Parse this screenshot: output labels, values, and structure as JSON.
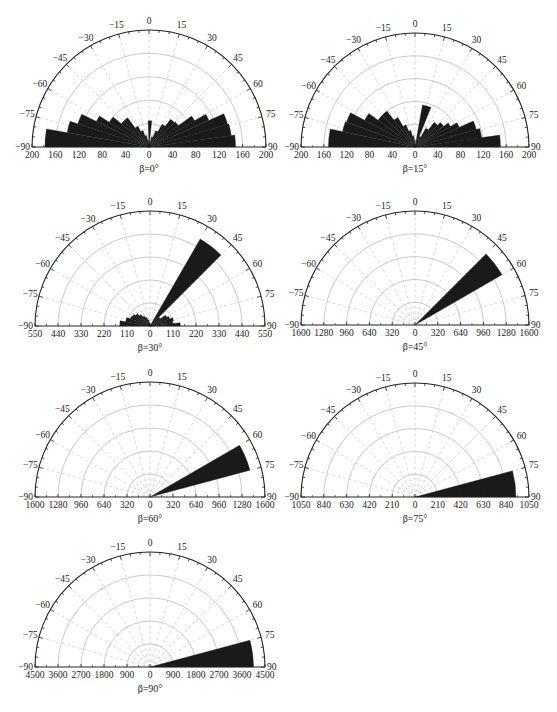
{
  "figure": {
    "caption": ""
  },
  "chart_data": [
    {
      "type": "polar-bar",
      "title": "β=0°",
      "angular_ticks": [
        -90,
        -75,
        -60,
        -45,
        -30,
        -15,
        0,
        15,
        30,
        45,
        60,
        75,
        90
      ],
      "radial_max": 200,
      "radial_tick_labels": [
        "200",
        "160",
        "120",
        "80",
        "40",
        "0",
        "40",
        "80",
        "120",
        "160",
        "200"
      ],
      "rings": [
        40,
        80,
        120,
        160
      ],
      "layout": {
        "cx": 149,
        "cy": 147,
        "r": 117
      },
      "bins": [
        {
          "from": -90,
          "to": -80,
          "value": 178
        },
        {
          "from": -80,
          "to": -72,
          "value": 142
        },
        {
          "from": -72,
          "to": -64,
          "value": 128
        },
        {
          "from": -64,
          "to": -58,
          "value": 100
        },
        {
          "from": -58,
          "to": -50,
          "value": 80
        },
        {
          "from": -50,
          "to": -44,
          "value": 62
        },
        {
          "from": -44,
          "to": -36,
          "value": 62
        },
        {
          "from": -36,
          "to": -28,
          "value": 40
        },
        {
          "from": -28,
          "to": -20,
          "value": 30
        },
        {
          "from": -20,
          "to": -12,
          "value": 20
        },
        {
          "from": -12,
          "to": -4,
          "value": 12
        },
        {
          "from": -4,
          "to": 4,
          "value": 5
        },
        {
          "from": -2,
          "to": 6,
          "value": 45
        },
        {
          "from": 6,
          "to": 14,
          "value": 8
        },
        {
          "from": 14,
          "to": 22,
          "value": 18
        },
        {
          "from": 22,
          "to": 30,
          "value": 30
        },
        {
          "from": 30,
          "to": 38,
          "value": 45
        },
        {
          "from": 38,
          "to": 46,
          "value": 60
        },
        {
          "from": 46,
          "to": 54,
          "value": 62
        },
        {
          "from": 54,
          "to": 60,
          "value": 90
        },
        {
          "from": 60,
          "to": 66,
          "value": 112
        },
        {
          "from": 66,
          "to": 74,
          "value": 140
        },
        {
          "from": 74,
          "to": 82,
          "value": 142
        },
        {
          "from": 82,
          "to": 90,
          "value": 148
        }
      ]
    },
    {
      "type": "polar-bar",
      "title": "β=15°",
      "angular_ticks": [
        -90,
        -75,
        -60,
        -45,
        -30,
        -15,
        0,
        15,
        30,
        45,
        60,
        75,
        90
      ],
      "radial_max": 200,
      "radial_tick_labels": [
        "200",
        "160",
        "120",
        "80",
        "40",
        "0",
        "40",
        "80",
        "120",
        "160",
        "200"
      ],
      "rings": [
        40,
        80,
        120,
        160
      ],
      "layout": {
        "cx": 415,
        "cy": 147,
        "r": 114
      },
      "bins": [
        {
          "from": -90,
          "to": -78,
          "value": 152
        },
        {
          "from": -78,
          "to": -70,
          "value": 130
        },
        {
          "from": -70,
          "to": -62,
          "value": 128
        },
        {
          "from": -62,
          "to": -54,
          "value": 100
        },
        {
          "from": -54,
          "to": -46,
          "value": 80
        },
        {
          "from": -46,
          "to": -38,
          "value": 80
        },
        {
          "from": -38,
          "to": -30,
          "value": 60
        },
        {
          "from": -30,
          "to": -22,
          "value": 42
        },
        {
          "from": -22,
          "to": -14,
          "value": 30
        },
        {
          "from": -14,
          "to": -6,
          "value": 20
        },
        {
          "from": -6,
          "to": 2,
          "value": 12
        },
        {
          "from": 10,
          "to": 22,
          "value": 75
        },
        {
          "from": 22,
          "to": 30,
          "value": 20
        },
        {
          "from": 30,
          "to": 38,
          "value": 38
        },
        {
          "from": 38,
          "to": 46,
          "value": 55
        },
        {
          "from": 46,
          "to": 54,
          "value": 62
        },
        {
          "from": 54,
          "to": 60,
          "value": 72
        },
        {
          "from": 60,
          "to": 66,
          "value": 85
        },
        {
          "from": 66,
          "to": 74,
          "value": 112
        },
        {
          "from": 74,
          "to": 82,
          "value": 118
        },
        {
          "from": 82,
          "to": 90,
          "value": 150
        }
      ]
    },
    {
      "type": "polar-bar",
      "title": "β=30°",
      "angular_ticks": [
        -90,
        -75,
        -60,
        -45,
        -30,
        -15,
        0,
        15,
        30,
        45,
        60,
        75,
        90
      ],
      "radial_max": 550,
      "radial_tick_labels": [
        "550",
        "440",
        "330",
        "220",
        "110",
        "0",
        "110",
        "220",
        "330",
        "440",
        "550"
      ],
      "rings": [
        110,
        220,
        330,
        440
      ],
      "layout": {
        "cx": 150,
        "cy": 326,
        "r": 115
      },
      "bins": [
        {
          "from": -90,
          "to": -80,
          "value": 145
        },
        {
          "from": -80,
          "to": -70,
          "value": 118
        },
        {
          "from": -70,
          "to": -62,
          "value": 100
        },
        {
          "from": -62,
          "to": -54,
          "value": 95
        },
        {
          "from": -54,
          "to": -46,
          "value": 85
        },
        {
          "from": -46,
          "to": -38,
          "value": 70
        },
        {
          "from": -38,
          "to": -30,
          "value": 55
        },
        {
          "from": -30,
          "to": -20,
          "value": 45
        },
        {
          "from": -20,
          "to": -10,
          "value": 30
        },
        {
          "from": -10,
          "to": 0,
          "value": 15
        },
        {
          "from": 30,
          "to": 45,
          "value": 480
        },
        {
          "from": 45,
          "to": 55,
          "value": 60
        },
        {
          "from": 55,
          "to": 62,
          "value": 90
        },
        {
          "from": 62,
          "to": 70,
          "value": 100
        },
        {
          "from": 70,
          "to": 78,
          "value": 115
        },
        {
          "from": 78,
          "to": 84,
          "value": 110
        },
        {
          "from": 84,
          "to": 90,
          "value": 145
        }
      ]
    },
    {
      "type": "polar-bar",
      "title": "β=45°",
      "angular_ticks": [
        -90,
        -75,
        -60,
        -45,
        -30,
        -15,
        0,
        15,
        30,
        45,
        60,
        75,
        90
      ],
      "radial_max": 1600,
      "radial_tick_labels": [
        "1600",
        "1280",
        "960",
        "640",
        "320",
        "0",
        "320",
        "640",
        "960",
        "1280",
        "1600"
      ],
      "rings": [
        320,
        640,
        960,
        1280
      ],
      "layout": {
        "cx": 415,
        "cy": 325,
        "r": 114
      },
      "bins": [
        {
          "from": 45,
          "to": 60,
          "value": 1410
        }
      ]
    },
    {
      "type": "polar-bar",
      "title": "β=60°",
      "angular_ticks": [
        -90,
        -75,
        -60,
        -45,
        -30,
        -15,
        0,
        15,
        30,
        45,
        60,
        75,
        90
      ],
      "radial_max": 1600,
      "radial_tick_labels": [
        "1600",
        "1280",
        "960",
        "640",
        "320",
        "0",
        "320",
        "640",
        "960",
        "1280",
        "1600"
      ],
      "rings": [
        320,
        640,
        960,
        1280
      ],
      "layout": {
        "cx": 150,
        "cy": 497,
        "r": 115
      },
      "bins": [
        {
          "from": 60,
          "to": 75,
          "value": 1440
        }
      ]
    },
    {
      "type": "polar-bar",
      "title": "β=75°",
      "angular_ticks": [
        -90,
        -75,
        -60,
        -45,
        -30,
        -15,
        0,
        15,
        30,
        45,
        60,
        75,
        90
      ],
      "radial_max": 1050,
      "radial_tick_labels": [
        "1050",
        "840",
        "630",
        "420",
        "210",
        "0",
        "210",
        "420",
        "630",
        "840",
        "1050"
      ],
      "rings": [
        210,
        420,
        630,
        840
      ],
      "layout": {
        "cx": 415,
        "cy": 497,
        "r": 114
      },
      "bins": [
        {
          "from": 75,
          "to": 90,
          "value": 930
        }
      ]
    },
    {
      "type": "polar-bar",
      "title": "β=90°",
      "angular_ticks": [
        -90,
        -75,
        -60,
        -45,
        -30,
        -15,
        0,
        15,
        30,
        45,
        60,
        75,
        90
      ],
      "radial_max": 4500,
      "radial_tick_labels": [
        "4500",
        "3600",
        "2700",
        "1800",
        "900",
        "0",
        "900",
        "1800",
        "2700",
        "3600",
        "4500"
      ],
      "rings": [
        900,
        1800,
        2700,
        3600
      ],
      "layout": {
        "cx": 150,
        "cy": 667,
        "r": 115
      },
      "bins": [
        {
          "from": 75,
          "to": 90,
          "value": 4050
        }
      ]
    }
  ]
}
